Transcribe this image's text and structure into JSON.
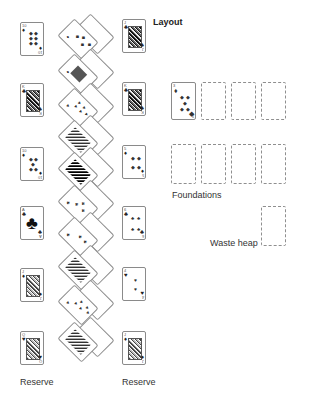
{
  "title": "Layout",
  "labels": {
    "reserve_left": "Reserve",
    "reserve_right": "Reserve",
    "foundations": "Foundations",
    "waste_heap": "Waste heap"
  },
  "reserve_left": [
    {
      "rank": "10",
      "suit": "♦"
    },
    {
      "rank": "K",
      "suit": "♣"
    },
    {
      "rank": "10",
      "suit": "♦"
    },
    {
      "rank": "A",
      "suit": "♣"
    },
    {
      "rank": "J",
      "suit": "♦"
    },
    {
      "rank": "Q",
      "suit": "♥"
    }
  ],
  "reserve_right": [
    {
      "rank": "J",
      "suit": "♣"
    },
    {
      "rank": "K",
      "suit": "♣"
    },
    {
      "rank": "5",
      "suit": "♦"
    },
    {
      "rank": "6",
      "suit": "♣"
    },
    {
      "rank": "4",
      "suit": "♥"
    },
    {
      "rank": "J",
      "suit": "♦"
    }
  ],
  "tableau_diagonal": [
    {
      "rank": "9",
      "suit": "♦",
      "overlap_suit": "♠"
    },
    {
      "rank": "A",
      "suit": "♦",
      "overlap_suit": "♥"
    },
    {
      "rank": "10",
      "suit": "♥",
      "overlap_suit": "♣"
    },
    {
      "rank": "K",
      "suit": "♥",
      "overlap_suit": "♦"
    },
    {
      "rank": "Q",
      "suit": "♠",
      "overlap_suit": "♠"
    },
    {
      "rank": "6",
      "suit": "♣",
      "overlap_suit": "♣"
    },
    {
      "rank": "5",
      "suit": "♣",
      "overlap_suit": "♣"
    },
    {
      "rank": "J",
      "suit": "♥",
      "overlap_suit": "♣"
    },
    {
      "rank": "9",
      "suit": "♥",
      "overlap_suit": "♠"
    },
    {
      "rank": "K",
      "suit": "♦",
      "overlap_suit": "♥"
    }
  ],
  "foundations": [
    {
      "rank": "3",
      "suit": "♦"
    },
    null,
    null,
    null,
    null,
    null,
    null,
    null
  ],
  "waste_heap": null
}
